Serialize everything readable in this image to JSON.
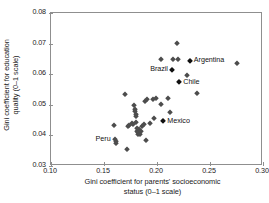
{
  "chart_data": {
    "type": "scatter",
    "title": "",
    "xlabel": "Gini coefficient for parents' socioeconomic status (0–1 scale)",
    "xlabel_line1": "Gini coefficient for parents' socioeconomic",
    "xlabel_line2": "status (0–1 scale)",
    "ylabel": "Gini coefficient for education quality (0–1 scale)",
    "ylabel_line1": "Gini coefficient for education",
    "ylabel_line2": "quality (0–1 scale)",
    "xlim": [
      0.1,
      0.3
    ],
    "ylim": [
      0.03,
      0.08
    ],
    "xticks": [
      0.1,
      0.15,
      0.2,
      0.25,
      0.3
    ],
    "xtick_labels": [
      "0.10",
      "0.15",
      "0.20",
      "0.25",
      "0.30"
    ],
    "yticks": [
      0.03,
      0.04,
      0.05,
      0.06,
      0.07,
      0.08
    ],
    "ytick_labels": [
      "0.03",
      "0.04",
      "0.05",
      "0.06",
      "0.07",
      "0.08"
    ],
    "grid": false,
    "legend": false,
    "marker": "diamond",
    "marker_color": "#4d4d4d",
    "points": [
      {
        "x": 0.159,
        "y": 0.0435
      },
      {
        "x": 0.16,
        "y": 0.0387,
        "label": "Peru",
        "label_pos": "left"
      },
      {
        "x": 0.161,
        "y": 0.0383
      },
      {
        "x": 0.161,
        "y": 0.0374
      },
      {
        "x": 0.17,
        "y": 0.0536
      },
      {
        "x": 0.172,
        "y": 0.0357
      },
      {
        "x": 0.173,
        "y": 0.0431
      },
      {
        "x": 0.174,
        "y": 0.0433
      },
      {
        "x": 0.176,
        "y": 0.0442
      },
      {
        "x": 0.177,
        "y": 0.0437
      },
      {
        "x": 0.178,
        "y": 0.0499
      },
      {
        "x": 0.179,
        "y": 0.0487
      },
      {
        "x": 0.179,
        "y": 0.0479
      },
      {
        "x": 0.18,
        "y": 0.0471
      },
      {
        "x": 0.18,
        "y": 0.0463
      },
      {
        "x": 0.18,
        "y": 0.0443
      },
      {
        "x": 0.181,
        "y": 0.0424
      },
      {
        "x": 0.181,
        "y": 0.0416
      },
      {
        "x": 0.182,
        "y": 0.0412
      },
      {
        "x": 0.182,
        "y": 0.0406
      },
      {
        "x": 0.183,
        "y": 0.0421
      },
      {
        "x": 0.183,
        "y": 0.041
      },
      {
        "x": 0.184,
        "y": 0.0404
      },
      {
        "x": 0.185,
        "y": 0.0415
      },
      {
        "x": 0.186,
        "y": 0.0432
      },
      {
        "x": 0.188,
        "y": 0.0437
      },
      {
        "x": 0.189,
        "y": 0.0513
      },
      {
        "x": 0.19,
        "y": 0.0384
      },
      {
        "x": 0.191,
        "y": 0.0519
      },
      {
        "x": 0.193,
        "y": 0.0441
      },
      {
        "x": 0.196,
        "y": 0.0519
      },
      {
        "x": 0.197,
        "y": 0.0457
      },
      {
        "x": 0.199,
        "y": 0.0521
      },
      {
        "x": 0.204,
        "y": 0.065
      },
      {
        "x": 0.204,
        "y": 0.0504
      },
      {
        "x": 0.206,
        "y": 0.0447,
        "label": "Mexico",
        "label_pos": "right",
        "highlight": true
      },
      {
        "x": 0.21,
        "y": 0.0521
      },
      {
        "x": 0.212,
        "y": 0.0476
      },
      {
        "x": 0.214,
        "y": 0.0614,
        "label": "Brazil",
        "label_pos": "left",
        "highlight": true
      },
      {
        "x": 0.215,
        "y": 0.065
      },
      {
        "x": 0.219,
        "y": 0.0702
      },
      {
        "x": 0.22,
        "y": 0.065
      },
      {
        "x": 0.221,
        "y": 0.0573,
        "label": "Chile",
        "label_pos": "right",
        "highlight": true
      },
      {
        "x": 0.228,
        "y": 0.0596
      },
      {
        "x": 0.231,
        "y": 0.0644,
        "label": "Argentina",
        "label_pos": "right",
        "highlight": true
      },
      {
        "x": 0.238,
        "y": 0.0537
      },
      {
        "x": 0.275,
        "y": 0.0638
      }
    ]
  }
}
